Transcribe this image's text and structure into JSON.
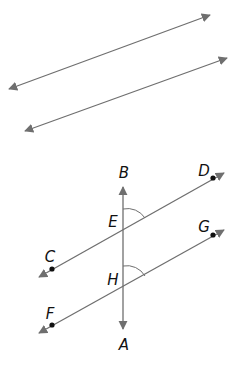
{
  "diagram": {
    "type": "geometry-parallel-lines-transversal",
    "colors": {
      "line": "#6f6f6f",
      "point": "#111111",
      "label": "#111111",
      "background": "#ffffff"
    },
    "top_figure": {
      "description": "Two parallel lines with arrows at both ends",
      "lines": [
        {
          "id": "line-1",
          "x1": 7,
          "y1": 90,
          "x2": 212,
          "y2": 14
        },
        {
          "id": "line-2",
          "x1": 23,
          "y1": 132,
          "x2": 229,
          "y2": 57
        }
      ]
    },
    "bottom_figure": {
      "description": "Transversal AB intersects parallel lines CD and FG at E and H; corresponding angles marked",
      "labels": {
        "A": "A",
        "B": "B",
        "C": "C",
        "D": "D",
        "E": "E",
        "F": "F",
        "G": "G",
        "H": "H"
      },
      "points": {
        "C": [
          52,
          269
        ],
        "D": [
          213,
          178
        ],
        "F": [
          52,
          325
        ],
        "G": [
          213,
          235
        ],
        "E": [
          123,
          230
        ],
        "H": [
          123,
          288
        ]
      },
      "angle_marks": [
        "angle BED",
        "angle EHG"
      ]
    }
  }
}
